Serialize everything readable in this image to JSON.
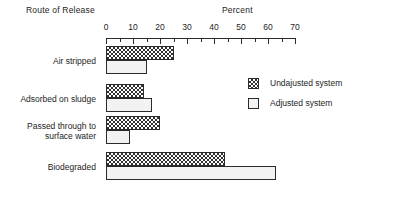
{
  "titles": {
    "category_axis": "Route of Release",
    "value_axis": "Percent"
  },
  "legend": {
    "items": [
      {
        "label": "Undajusted system",
        "pattern": "checkerboard",
        "color": "#2f2f2f"
      },
      {
        "label": "Adjusted system",
        "pattern": "stipple",
        "color": "#f2f2f2"
      }
    ]
  },
  "axis": {
    "ticks": [
      "0",
      "10",
      "20",
      "30",
      "40",
      "50",
      "60",
      "70"
    ],
    "min": 0,
    "max": 70,
    "minor_step": 5
  },
  "chart_data": {
    "type": "bar",
    "orientation": "horizontal",
    "title": "",
    "xlabel": "Percent",
    "ylabel": "Route of Release",
    "xlim": [
      0,
      70
    ],
    "grid": false,
    "legend_position": "right-middle",
    "categories": [
      "Air stripped",
      "Adsorbed on sludge",
      "Passed through to surface water",
      "Biodegraded"
    ],
    "category_label_lines": [
      [
        "Air stripped"
      ],
      [
        "Adsorbed on sludge"
      ],
      [
        "Passed through to",
        "surface water"
      ],
      [
        "Biodegraded"
      ]
    ],
    "series": [
      {
        "name": "Undajusted system",
        "values": [
          25,
          14,
          20,
          44
        ]
      },
      {
        "name": "Adjusted system",
        "values": [
          15,
          17,
          9,
          63
        ]
      }
    ]
  }
}
